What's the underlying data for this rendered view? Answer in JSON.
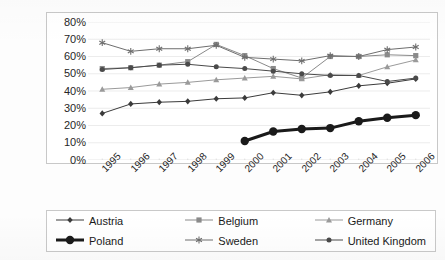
{
  "chart_data": {
    "type": "line",
    "title": "",
    "subtitle": "",
    "xlabel": "",
    "ylabel": "",
    "categories": [
      "1995",
      "1996",
      "1997",
      "1998",
      "1999",
      "2000",
      "2001",
      "2002",
      "2003",
      "2004",
      "2005",
      "2006"
    ],
    "ylim": [
      0,
      80
    ],
    "ytick_labels": [
      "0%",
      "10%",
      "20%",
      "30%",
      "40%",
      "50%",
      "60%",
      "70%",
      "80%"
    ],
    "ytick_values": [
      0,
      10,
      20,
      30,
      40,
      50,
      60,
      70,
      80
    ],
    "grid": true,
    "legend_position": "bottom",
    "value_suffix": "%",
    "series": [
      {
        "name": "Austria",
        "marker": "diamond",
        "color": "#3b3b3b",
        "line_width": 1,
        "values": [
          27,
          32.5,
          33.5,
          34,
          35.5,
          36,
          39,
          37.5,
          39.5,
          43,
          44.5,
          47
        ]
      },
      {
        "name": "Belgium",
        "marker": "square",
        "color": "#8a8a8a",
        "line_width": 1,
        "values": [
          53,
          53.5,
          55,
          57,
          67,
          60.5,
          53,
          47.5,
          60,
          60,
          61,
          60.5
        ]
      },
      {
        "name": "Germany",
        "marker": "triangle",
        "color": "#9a9a9a",
        "line_width": 1,
        "values": [
          41,
          42,
          44,
          45,
          46.5,
          47.5,
          48.5,
          47,
          49.5,
          49,
          54,
          58
        ]
      },
      {
        "name": "Poland",
        "marker": "circle-large",
        "color": "#1a1a1a",
        "line_width": 3,
        "values": [
          null,
          null,
          null,
          null,
          null,
          11,
          16.5,
          18,
          18.5,
          22.5,
          24.5,
          26
        ]
      },
      {
        "name": "Sweden",
        "marker": "asterisk",
        "color": "#6e6e6e",
        "line_width": 1,
        "values": [
          68,
          63,
          64.5,
          64.5,
          66.5,
          59.5,
          58.5,
          57.5,
          60.5,
          60,
          64,
          65.5
        ]
      },
      {
        "name": "United Kingdom",
        "marker": "circle",
        "color": "#4a4a4a",
        "line_width": 1,
        "values": [
          52.5,
          53.5,
          55,
          55.5,
          54,
          53,
          51.5,
          50,
          49,
          49,
          45.5,
          47.5
        ]
      }
    ]
  }
}
